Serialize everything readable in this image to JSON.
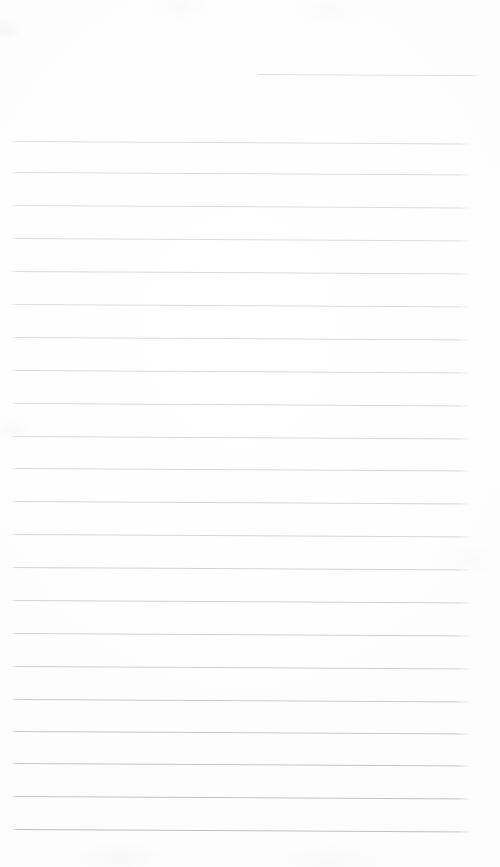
{
  "document": {
    "kind": "lined-paper-sheet",
    "title": "Blank ruled notepad page",
    "content_text": "",
    "page_width": 500,
    "page_height": 867,
    "background_color": "#fefefe",
    "paper_tint_color": "#fbfbfb",
    "rule_color": "#b9bcc0",
    "rule_thickness_px": 1,
    "rule_spacing_px": 32.7,
    "rule_left_x": 11,
    "rule_right_x": 471,
    "rule_slope_px": 2.5,
    "first_rule_y": 141,
    "last_rule_y": 829,
    "full_rule_count": 22,
    "has_partial_top_rule": true,
    "text_lines": []
  },
  "partial_rule": {
    "label": "short-top-rule",
    "x": 257,
    "y": 74,
    "width": 221,
    "opacity": 0.45
  },
  "rules": [
    {
      "y": 141,
      "opacity": 0.5
    },
    {
      "y": 172,
      "opacity": 0.52
    },
    {
      "y": 205,
      "opacity": 0.5
    },
    {
      "y": 238,
      "opacity": 0.52
    },
    {
      "y": 271,
      "opacity": 0.54
    },
    {
      "y": 304,
      "opacity": 0.52
    },
    {
      "y": 337,
      "opacity": 0.56
    },
    {
      "y": 370,
      "opacity": 0.54
    },
    {
      "y": 403,
      "opacity": 0.58
    },
    {
      "y": 436,
      "opacity": 0.58
    },
    {
      "y": 468,
      "opacity": 0.6
    },
    {
      "y": 501,
      "opacity": 0.62
    },
    {
      "y": 534,
      "opacity": 0.62
    },
    {
      "y": 567,
      "opacity": 0.66
    },
    {
      "y": 600,
      "opacity": 0.68
    },
    {
      "y": 633,
      "opacity": 0.7
    },
    {
      "y": 666,
      "opacity": 0.72
    },
    {
      "y": 699,
      "opacity": 0.76
    },
    {
      "y": 731,
      "opacity": 0.8
    },
    {
      "y": 763,
      "opacity": 0.84
    },
    {
      "y": 796,
      "opacity": 0.88
    },
    {
      "y": 829,
      "opacity": 0.92
    }
  ]
}
